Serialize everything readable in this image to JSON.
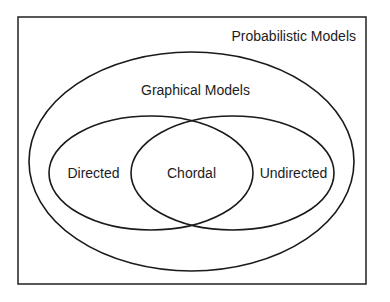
{
  "diagram": {
    "type": "venn",
    "colors": {
      "background": "#ffffff",
      "stroke": "#1a1a1a",
      "text": "#1c1c1c"
    },
    "universe": {
      "label": "Probabilistic Models",
      "box": {
        "x": 18,
        "y": 17,
        "width": 348,
        "height": 267
      }
    },
    "sets": [
      {
        "id": "graphical",
        "label": "Graphical Models",
        "ellipse": {
          "cx": 191.5,
          "cy": 161.5,
          "rx": 162.5,
          "ry": 109.5
        }
      },
      {
        "id": "directed",
        "label": "Directed",
        "parent": "graphical",
        "ellipse": {
          "cx": 151,
          "cy": 173,
          "rx": 102,
          "ry": 57
        }
      },
      {
        "id": "undirected",
        "label": "Undirected",
        "parent": "graphical",
        "ellipse": {
          "cx": 232.5,
          "cy": 173,
          "rx": 101.5,
          "ry": 57
        }
      }
    ],
    "intersections": [
      {
        "sets": [
          "directed",
          "undirected"
        ],
        "label": "Chordal"
      }
    ],
    "labels": {
      "probabilistic": "Probabilistic Models",
      "graphical": "Graphical Models",
      "directed": "Directed",
      "chordal": "Chordal",
      "undirected": "Undirected"
    }
  }
}
